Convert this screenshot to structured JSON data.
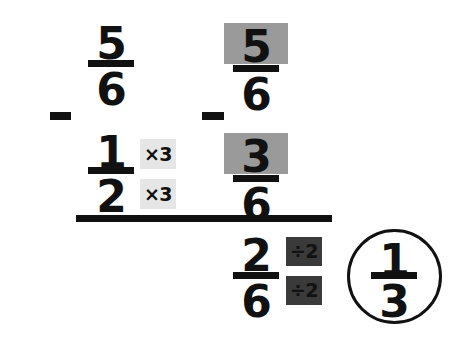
{
  "diagram": {
    "colors": {
      "ink": "#111111",
      "highlight_box": "#9a9a9a",
      "badge_light_bg": "#e6e6e6",
      "badge_dark_bg": "#3a3a3a",
      "background": "#ffffff"
    },
    "operator_left": "−",
    "operator_right": "−",
    "left_column": {
      "fraction_top": {
        "numerator": "5",
        "denominator": "6"
      },
      "fraction_bottom": {
        "numerator": "1",
        "denominator": "2"
      },
      "badge_numerator": "×3",
      "badge_denominator": "×3"
    },
    "right_column": {
      "fraction_top": {
        "numerator": "5",
        "denominator": "6",
        "numerator_highlighted": true
      },
      "fraction_bottom": {
        "numerator": "3",
        "denominator": "6",
        "numerator_highlighted": true
      }
    },
    "result": {
      "fraction": {
        "numerator": "2",
        "denominator": "6"
      },
      "badge_numerator": "÷2",
      "badge_denominator": "÷2"
    },
    "answer": {
      "numerator": "1",
      "denominator": "3",
      "circled": true
    }
  }
}
